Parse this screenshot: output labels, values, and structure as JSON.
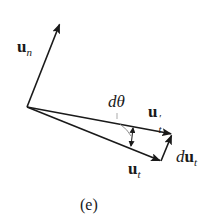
{
  "figure": {
    "caption": "(e)",
    "labels": {
      "un": {
        "base": "u",
        "sub": "n"
      },
      "dtheta": "dθ",
      "ut_prime": {
        "base": "u",
        "sup": "′",
        "sub": "t"
      },
      "ut": {
        "base": "u",
        "sub": "t"
      },
      "dut": {
        "prefix": "d",
        "base": "u",
        "sub": "t"
      }
    },
    "vectors": [
      {
        "name": "u_n",
        "from": [
          27,
          107
        ],
        "to": [
          60,
          23
        ]
      },
      {
        "name": "u_t_prime",
        "from": [
          27,
          107
        ],
        "to": [
          172,
          134
        ]
      },
      {
        "name": "u_t",
        "from": [
          27,
          107
        ],
        "to": [
          161,
          161
        ]
      },
      {
        "name": "du_t",
        "from": [
          161,
          161
        ],
        "to": [
          172,
          134
        ]
      }
    ],
    "colors": {
      "stroke": "#1a1a1a",
      "angle_arc": "#555555"
    }
  }
}
